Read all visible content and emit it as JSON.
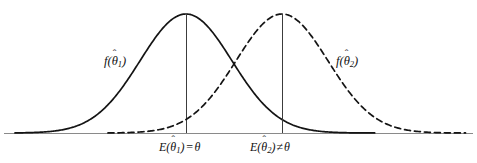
{
  "figure": {
    "title": "",
    "background_color": "#ffffff",
    "width": 477,
    "height": 163
  },
  "labels": {
    "curve1": {
      "function_name": "f",
      "open_paren": "(",
      "theta": "θ",
      "hat": "ˆ",
      "subscript": "1",
      "close_paren": ")",
      "full_text": "f(θ̂1)"
    },
    "curve2": {
      "function_name": "f",
      "open_paren": "(",
      "theta": "θ",
      "hat": "ˆ",
      "subscript": "2",
      "close_paren": ")",
      "full_text": "f(θ̂2)"
    },
    "mean1": {
      "expectation": "E",
      "open_paren": "(",
      "theta": "θ",
      "hat": "ˆ",
      "subscript": "1",
      "close_paren": ")",
      "operator": "=",
      "parameter": "θ",
      "full_text": "E(θ̂1) = θ"
    },
    "mean2": {
      "expectation": "E",
      "open_paren": "(",
      "theta": "θ",
      "hat": "ˆ",
      "subscript": "2",
      "close_paren": ")",
      "operator": "≠",
      "parameter": "θ",
      "full_text": "E(θ̂2) ≠ θ"
    }
  },
  "colors": {
    "curve": "#141414",
    "axis": "#8a8a8a",
    "mean_line": "#3c3c3c",
    "text": "#111111"
  },
  "chart_data": {
    "type": "line",
    "title": "",
    "xlabel": "",
    "ylabel": "",
    "grid": false,
    "legend": "inline-annotations",
    "axis": {
      "baseline_y_px": 133,
      "x_start_px": 4,
      "x_end_px": 473,
      "xlim": [
        0,
        477
      ],
      "ylim": [
        0,
        1.05
      ]
    },
    "series": [
      {
        "name": "f(θ̂1)",
        "style": "solid",
        "color": "#141414",
        "distribution": "normal",
        "mean_px": 186,
        "sigma_px": 46,
        "peak_y_px": 14,
        "amplitude": 1.0,
        "x_range_px": [
          15,
          375
        ],
        "mean_line": true,
        "label_text": "f(θ̂1)",
        "label_pos_px": [
          104,
          55
        ],
        "unbiased": true
      },
      {
        "name": "f(θ̂2)",
        "style": "dashed",
        "color": "#141414",
        "dash_pattern": [
          6,
          4
        ],
        "distribution": "normal",
        "mean_px": 282,
        "sigma_px": 46,
        "peak_y_px": 14,
        "amplitude": 1.0,
        "x_range_px": [
          108,
          466
        ],
        "mean_line": true,
        "label_text": "f(θ̂2)",
        "label_pos_px": [
          336,
          55
        ],
        "unbiased": false
      }
    ],
    "annotations": [
      {
        "text": "E(θ̂1) = θ",
        "x_px": 186,
        "y_px": 147,
        "anchor": "middle"
      },
      {
        "text": "E(θ̂2) ≠ θ",
        "x_px": 282,
        "y_px": 147,
        "anchor": "middle"
      }
    ],
    "intersection_px": [
      234,
      62
    ]
  }
}
